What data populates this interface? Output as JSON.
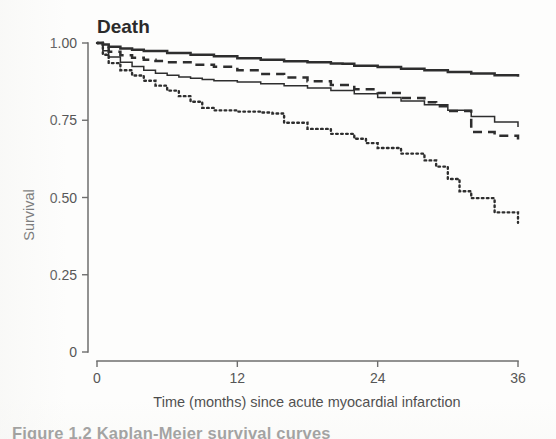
{
  "page": {
    "background": "#fdfdfc",
    "ink_color": "#2e2e2e",
    "caption_partial": "Figure 1.2 Kaplan-Meier survival curves"
  },
  "chart_data": {
    "type": "line",
    "title": "Death",
    "subtitle": "",
    "xlabel": "Time (months) since acute myocardial infarction",
    "ylabel": "Survival",
    "xlim": [
      0,
      36
    ],
    "ylim": [
      0,
      1.0
    ],
    "xticks": [
      0,
      12,
      24,
      36
    ],
    "xtick_labels": [
      "0",
      "12",
      "24",
      "36"
    ],
    "yticks": [
      0,
      0.25,
      0.5,
      0.75,
      1.0
    ],
    "ytick_labels": [
      "0",
      "0.25",
      "0.50",
      "0.75",
      "1.00"
    ],
    "grid": false,
    "legend_position": "none",
    "step_function": true,
    "annotations": [],
    "series": [
      {
        "name": "curve-1-thick-solid",
        "style": "solid",
        "line_width": 2.5,
        "color": "#2e2e2e",
        "x": [
          0,
          0.5,
          1,
          2,
          3,
          4,
          6,
          8,
          10,
          12,
          14,
          16,
          18,
          20,
          21,
          22,
          24,
          26,
          28,
          30,
          32,
          34,
          36
        ],
        "y": [
          1.0,
          0.995,
          0.988,
          0.982,
          0.978,
          0.974,
          0.968,
          0.962,
          0.957,
          0.951,
          0.946,
          0.941,
          0.938,
          0.934,
          0.933,
          0.926,
          0.922,
          0.917,
          0.912,
          0.906,
          0.901,
          0.896,
          0.891
        ]
      },
      {
        "name": "curve-2-dashed",
        "style": "dashed",
        "line_width": 2.5,
        "color": "#2e2e2e",
        "x": [
          0,
          0.5,
          1,
          2,
          3,
          4,
          5,
          6,
          8,
          10,
          12,
          14,
          16,
          18,
          20,
          22,
          24,
          26,
          28,
          29,
          30,
          32,
          34,
          36
        ],
        "y": [
          1.0,
          0.985,
          0.972,
          0.96,
          0.952,
          0.946,
          0.942,
          0.938,
          0.93,
          0.923,
          0.912,
          0.9,
          0.888,
          0.876,
          0.864,
          0.85,
          0.838,
          0.822,
          0.808,
          0.795,
          0.78,
          0.712,
          0.7,
          0.688
        ]
      },
      {
        "name": "curve-3-thin-solid",
        "style": "solid",
        "line_width": 1.5,
        "color": "#2e2e2e",
        "x": [
          0,
          0.5,
          1,
          2,
          3,
          4,
          5,
          6,
          7,
          8,
          9,
          10,
          12,
          14,
          16,
          18,
          20,
          22,
          24,
          26,
          28,
          30,
          32,
          34,
          36
        ],
        "y": [
          1.0,
          0.975,
          0.955,
          0.938,
          0.924,
          0.912,
          0.902,
          0.896,
          0.89,
          0.886,
          0.882,
          0.878,
          0.874,
          0.868,
          0.862,
          0.854,
          0.846,
          0.836,
          0.824,
          0.812,
          0.8,
          0.782,
          0.762,
          0.744,
          0.728
        ]
      },
      {
        "name": "curve-4-dotted",
        "style": "dotted",
        "line_width": 2.4,
        "color": "#2e2e2e",
        "x": [
          0,
          0.5,
          1,
          2,
          3,
          4,
          5,
          6,
          7,
          8,
          9,
          10,
          12,
          14,
          15,
          16,
          18,
          20,
          22,
          23,
          24,
          26,
          28,
          29,
          30,
          31,
          32,
          34,
          36
        ],
        "y": [
          1.0,
          0.962,
          0.935,
          0.912,
          0.895,
          0.878,
          0.862,
          0.846,
          0.828,
          0.81,
          0.79,
          0.782,
          0.778,
          0.775,
          0.772,
          0.742,
          0.722,
          0.706,
          0.69,
          0.676,
          0.66,
          0.642,
          0.62,
          0.6,
          0.56,
          0.52,
          0.498,
          0.452,
          0.418
        ]
      }
    ]
  }
}
